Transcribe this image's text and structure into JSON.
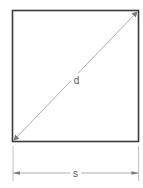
{
  "diagram": {
    "shape": "square",
    "labels": {
      "diagonal": "d",
      "side": "s"
    },
    "dimensions": [
      {
        "name": "diagonal",
        "label": "d",
        "from": "bottom-left corner",
        "to": "top-right corner",
        "arrows": "both"
      },
      {
        "name": "side",
        "label": "s",
        "from": "left edge",
        "to": "right edge",
        "arrows": "both",
        "placement": "below square"
      }
    ],
    "colors": {
      "outline": "#3a3a3a",
      "dimension": "#9a9a9a",
      "text": "#555555",
      "background": "#ffffff"
    }
  }
}
